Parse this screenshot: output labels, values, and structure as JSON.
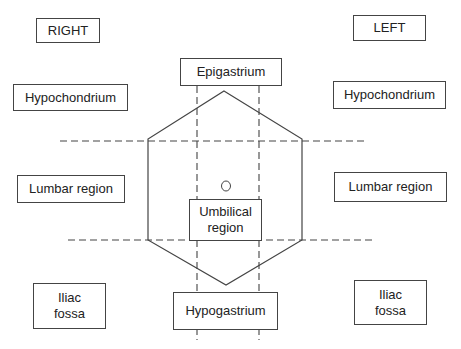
{
  "diagram": {
    "side_labels": {
      "right": "RIGHT",
      "left": "LEFT"
    },
    "regions": {
      "right_hypochondrium": "Hypochondrium",
      "left_hypochondrium": "Hypochondrium",
      "epigastrium": "Epigastrium",
      "right_lumbar": "Lumbar region",
      "left_lumbar": "Lumbar region",
      "umbilical_line1": "Umbilical",
      "umbilical_line2": "region",
      "right_iliac_line1": "Iliac",
      "right_iliac_line2": "fossa",
      "left_iliac_line1": "Iliac",
      "left_iliac_line2": "fossa",
      "hypogastrium": "Hypogastrium"
    },
    "colors": {
      "line": "#444444",
      "text": "#222222",
      "background": "#ffffff"
    }
  }
}
